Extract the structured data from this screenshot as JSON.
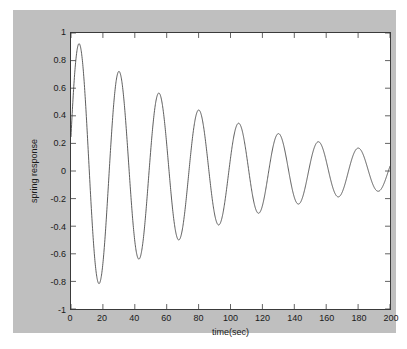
{
  "figure": {
    "background_color": "#bfbfbf",
    "page_color": "#ffffff",
    "axes_background": "#ffffff",
    "axes_border_color": "#3a3a3a",
    "line_color": "#4a4a4a"
  },
  "chart_data": {
    "type": "line",
    "title": "",
    "subtitle": "",
    "xlabel": "time(sec)",
    "ylabel": "spring response",
    "xlim": [
      0,
      200
    ],
    "ylim": [
      -1,
      1
    ],
    "xticks": [
      0,
      20,
      40,
      60,
      80,
      100,
      120,
      140,
      160,
      180,
      200
    ],
    "xtick_labels": [
      "0",
      "20",
      "40",
      "60",
      "80",
      "100",
      "120",
      "140",
      "160",
      "180",
      "200"
    ],
    "yticks": [
      -1,
      -0.8,
      -0.6,
      -0.4,
      -0.2,
      0,
      0.2,
      0.4,
      0.6,
      0.8,
      1
    ],
    "ytick_labels": [
      "-1",
      "-0.8",
      "-0.6",
      "-0.4",
      "-0.2",
      "0",
      "0.2",
      "0.4",
      "0.6",
      "0.8",
      "1"
    ],
    "grid": false,
    "legend": null,
    "legend_position": "none",
    "annotations": [],
    "tick_direction": "in",
    "series": [
      {
        "name": "spring response",
        "color": "#4a4a4a",
        "line_width": 0.9,
        "description": "Underdamped free vibration of a spring-mass-damper system; exponentially decaying sinusoid.",
        "model": {
          "form": "y(t) = A * exp(-zeta_wn * t) * sin(wd * t + phi)",
          "amplitude_A": 0.97,
          "decay_rate_per_sec": 0.0098,
          "angular_frequency_wd": 0.2513,
          "period_sec": 25.0,
          "phase_rad": 0.26
        },
        "peaks": [
          {
            "t": 6,
            "y": 0.93
          },
          {
            "t": 31,
            "y": 0.73
          },
          {
            "t": 56,
            "y": 0.57
          },
          {
            "t": 81,
            "y": 0.44
          },
          {
            "t": 106,
            "y": 0.34
          },
          {
            "t": 131,
            "y": 0.26
          },
          {
            "t": 156,
            "y": 0.2
          },
          {
            "t": 181,
            "y": 0.16
          }
        ],
        "troughs": [
          {
            "t": 18.5,
            "y": -0.83
          },
          {
            "t": 43.5,
            "y": -0.64
          },
          {
            "t": 68.5,
            "y": -0.5
          },
          {
            "t": 93.5,
            "y": -0.39
          },
          {
            "t": 118.5,
            "y": -0.3
          },
          {
            "t": 143.5,
            "y": -0.23
          },
          {
            "t": 168.5,
            "y": -0.18
          },
          {
            "t": 193.5,
            "y": -0.14
          }
        ],
        "zero_crossings": [
          12.5,
          25,
          37.5,
          50,
          62.5,
          75,
          87.5,
          100,
          112.5,
          125,
          137.5,
          150,
          162.5,
          175,
          187.5,
          200
        ],
        "start_point": {
          "t": 0,
          "y": 0.25
        },
        "end_point": {
          "t": 200,
          "y": -0.05
        }
      }
    ]
  }
}
